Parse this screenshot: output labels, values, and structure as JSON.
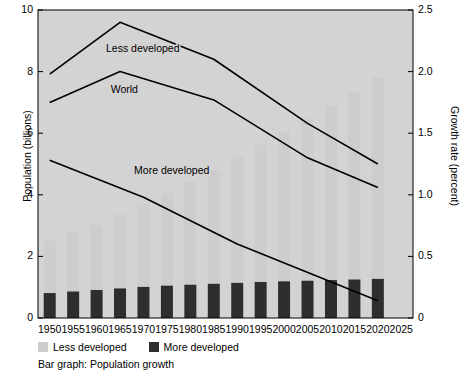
{
  "chart_data": {
    "type": "bar",
    "title": "",
    "caption": "Bar graph: Population growth",
    "xlabel": "",
    "ylabel": "Population (billions)",
    "ylabel_right": "Growth rate (percent)",
    "categories": [
      "1950",
      "1955",
      "1960",
      "1965",
      "1970",
      "1975",
      "1980",
      "1985",
      "1990",
      "1995",
      "2000",
      "2005",
      "2010",
      "2015",
      "2020",
      "2025"
    ],
    "xlim": [
      1947.5,
      2027.5
    ],
    "ylim": [
      0,
      10
    ],
    "yticks": [
      "0",
      "2",
      "4",
      "6",
      "8",
      "10"
    ],
    "ytick_values": [
      0,
      2,
      4,
      6,
      8,
      10
    ],
    "ylim_right": [
      0,
      2.5
    ],
    "yticks_right": [
      "0",
      "0.5",
      "1.0",
      "1.5",
      "2.0",
      "2.5"
    ],
    "ytick_right_values": [
      0,
      0.5,
      1.0,
      1.5,
      2.0,
      2.5
    ],
    "grid": false,
    "legend_position": "below-left",
    "bar_series": [
      {
        "name": "More developed",
        "color": "#2e2e2e",
        "axis": "left",
        "values": [
          0.81,
          0.86,
          0.91,
          0.96,
          1.01,
          1.05,
          1.08,
          1.11,
          1.14,
          1.17,
          1.19,
          1.21,
          1.23,
          1.25,
          1.27,
          null
        ]
      },
      {
        "name": "Less developed",
        "color": "#cdcdcd",
        "axis": "left",
        "values": [
          1.71,
          1.92,
          2.1,
          2.39,
          2.7,
          3.0,
          3.34,
          3.69,
          4.09,
          4.46,
          4.86,
          5.25,
          5.66,
          6.09,
          6.53,
          null
        ]
      },
      {
        "name": "Total population (stacked)",
        "color": "",
        "axis": "left",
        "values": [
          2.52,
          2.78,
          3.01,
          3.35,
          3.71,
          4.05,
          4.42,
          4.8,
          5.23,
          5.63,
          6.05,
          6.46,
          6.89,
          7.34,
          7.8,
          null
        ]
      }
    ],
    "line_series": [
      {
        "name": "Less developed",
        "color": "#000000",
        "axis": "right",
        "x": [
          "1950",
          "1965",
          "1985",
          "2005",
          "2020"
        ],
        "values": [
          1.98,
          2.4,
          2.1,
          1.58,
          1.25
        ],
        "label_text": "Less developed",
        "label_x": 1962,
        "label_y": 2.16
      },
      {
        "name": "World",
        "color": "#000000",
        "axis": "right",
        "x": [
          "1950",
          "1965",
          "1985",
          "2005",
          "2020"
        ],
        "values": [
          1.75,
          2.0,
          1.77,
          1.3,
          1.06
        ],
        "label_text": "World",
        "label_x": 1963,
        "label_y": 1.83
      },
      {
        "name": "More developed",
        "color": "#000000",
        "axis": "right",
        "x": [
          "1950",
          "1970",
          "1990",
          "2020"
        ],
        "values": [
          1.28,
          0.98,
          0.6,
          0.14
        ],
        "label_text": "More developed",
        "label_x": 1968,
        "label_y": 1.17
      }
    ],
    "legend": [
      {
        "label": "Less developed",
        "swatch": "less"
      },
      {
        "label": "More developed",
        "swatch": "more"
      }
    ],
    "plot_background": "#d3d3d3"
  },
  "colors": {
    "plot_bg": "#d3d3d3",
    "less_developed_bar": "#cdcdcd",
    "more_developed_bar": "#2e2e2e",
    "line": "#000000",
    "axis": "#000000",
    "page_bg": "#ffffff"
  }
}
